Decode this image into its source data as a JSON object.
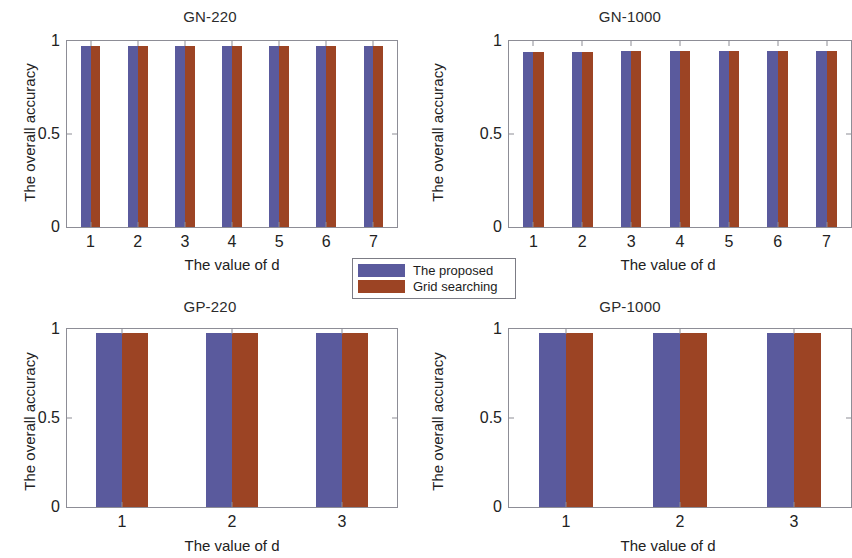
{
  "figure": {
    "legend": {
      "entries": [
        {
          "label": "The proposed",
          "color": "#5a5a9d",
          "key": "proposed"
        },
        {
          "label": "Grid searching",
          "color": "#9c4424",
          "key": "grid"
        }
      ]
    }
  },
  "chart_data": [
    {
      "type": "bar",
      "title": "GN-220",
      "xlabel": "The value of d",
      "ylabel": "The overall accuracy",
      "categories": [
        "1",
        "2",
        "3",
        "4",
        "5",
        "6",
        "7"
      ],
      "series": [
        {
          "name": "The proposed",
          "color": "#5a5a9d",
          "values": [
            0.975,
            0.975,
            0.975,
            0.975,
            0.975,
            0.975,
            0.975
          ]
        },
        {
          "name": "Grid searching",
          "color": "#9c4424",
          "values": [
            0.975,
            0.975,
            0.975,
            0.975,
            0.975,
            0.975,
            0.975
          ]
        }
      ],
      "ylim": [
        0,
        1
      ],
      "yticks": [
        0,
        0.5,
        1
      ],
      "yticklabels": [
        "0",
        "0.5",
        "1"
      ],
      "grid": false,
      "legend_position": "outside-below-center"
    },
    {
      "type": "bar",
      "title": "GN-1000",
      "xlabel": "The value of d",
      "ylabel": "The overall accuracy",
      "categories": [
        "1",
        "2",
        "3",
        "4",
        "5",
        "6",
        "7"
      ],
      "series": [
        {
          "name": "The proposed",
          "color": "#5a5a9d",
          "values": [
            0.94,
            0.94,
            0.948,
            0.948,
            0.948,
            0.948,
            0.948
          ]
        },
        {
          "name": "Grid searching",
          "color": "#9c4424",
          "values": [
            0.94,
            0.94,
            0.948,
            0.948,
            0.948,
            0.948,
            0.948
          ]
        }
      ],
      "ylim": [
        0,
        1
      ],
      "yticks": [
        0,
        0.5,
        1
      ],
      "yticklabels": [
        "0",
        "0.5",
        "1"
      ],
      "grid": false,
      "legend_position": "outside-above-left"
    },
    {
      "type": "bar",
      "title": "GP-220",
      "xlabel": "The value of d",
      "ylabel": "The overall accuracy",
      "categories": [
        "1",
        "2",
        "3"
      ],
      "series": [
        {
          "name": "The proposed",
          "color": "#5a5a9d",
          "values": [
            0.978,
            0.978,
            0.978
          ]
        },
        {
          "name": "Grid searching",
          "color": "#9c4424",
          "values": [
            0.978,
            0.978,
            0.978
          ]
        }
      ],
      "ylim": [
        0,
        1
      ],
      "yticks": [
        0,
        0.5,
        1
      ],
      "yticklabels": [
        "0",
        "0.5",
        "1"
      ],
      "grid": false,
      "legend_position": "none"
    },
    {
      "type": "bar",
      "title": "GP-1000",
      "xlabel": "The value of d",
      "ylabel": "The overall accuracy",
      "categories": [
        "1",
        "2",
        "3"
      ],
      "series": [
        {
          "name": "The proposed",
          "color": "#5a5a9d",
          "values": [
            0.978,
            0.978,
            0.978
          ]
        },
        {
          "name": "Grid searching",
          "color": "#9c4424",
          "values": [
            0.978,
            0.978,
            0.978
          ]
        }
      ],
      "ylim": [
        0,
        1
      ],
      "yticks": [
        0,
        0.5,
        1
      ],
      "yticklabels": [
        "0",
        "0.5",
        "1"
      ],
      "grid": false,
      "legend_position": "none"
    }
  ]
}
